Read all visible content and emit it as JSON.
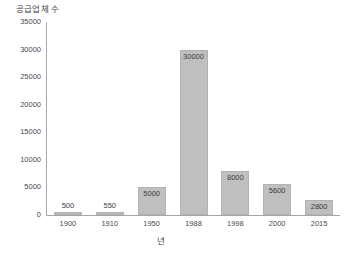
{
  "chart_data": {
    "type": "bar",
    "title": "",
    "xlabel": "년",
    "ylabel": "공급업체 수",
    "categories": [
      "1900",
      "1910",
      "1950",
      "1988",
      "1998",
      "2000",
      "2015"
    ],
    "values": [
      500,
      550,
      5000,
      30000,
      8000,
      5600,
      2800
    ],
    "data_labels": [
      "500",
      "550",
      "5000",
      "30000",
      "8000",
      "5600",
      "2800"
    ],
    "label_placement": [
      "outside",
      "outside",
      "inside",
      "inside",
      "inside",
      "inside",
      "inside"
    ],
    "ylim": [
      0,
      35000
    ],
    "ytick_labels": [
      "0",
      "5000",
      "10000",
      "15000",
      "20000",
      "25000",
      "30000",
      "35000"
    ],
    "ytick_values": [
      0,
      5000,
      10000,
      15000,
      20000,
      25000,
      30000,
      35000
    ],
    "grid": false,
    "legend": null,
    "bar_color": "#bfbfbf",
    "bar_border_color": "#b2b2b2",
    "axis_color": "#a6a6a6",
    "text_color": "#3f3f3f",
    "background": "#ffffff"
  }
}
